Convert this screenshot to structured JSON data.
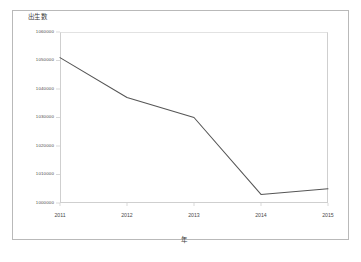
{
  "chart_data": {
    "type": "line",
    "title": "",
    "xlabel": "年",
    "ylabel": "出生数",
    "categories": [
      "2011",
      "2012",
      "2013",
      "2014",
      "2015"
    ],
    "x": [
      2011,
      2012,
      2013,
      2014,
      2015
    ],
    "values": [
      1051000,
      1037000,
      1030000,
      1003000,
      1005000
    ],
    "series": [
      {
        "name": "出生数",
        "values": [
          1051000,
          1037000,
          1030000,
          1003000,
          1005000
        ],
        "color": "#555555"
      }
    ],
    "ylim": [
      1000000,
      1060000
    ],
    "xlim": [
      2011,
      2015
    ],
    "yticks": [
      1060000,
      1050000,
      1040000,
      1030000,
      1020000,
      1010000,
      1000000
    ],
    "ytick_labels": [
      "1060000",
      "1050000",
      "1040000",
      "1030000",
      "1020000",
      "1010000",
      "1000000"
    ],
    "xticks": [
      2011,
      2012,
      2013,
      2014,
      2015
    ],
    "xtick_labels": [
      "2011",
      "2012",
      "2013",
      "2014",
      "2015"
    ],
    "grid": false,
    "legend": false,
    "legend_position": "none"
  },
  "axes": {
    "y_title": "出生数",
    "x_title": "年",
    "y_tick_0": "1060000",
    "y_tick_1": "1050000",
    "y_tick_2": "1040000",
    "y_tick_3": "1030000",
    "y_tick_4": "1020000",
    "y_tick_5": "1010000",
    "y_tick_6": "1000000",
    "x_tick_0": "2011",
    "x_tick_1": "2012",
    "x_tick_2": "2013",
    "x_tick_3": "2014",
    "x_tick_4": "2015"
  },
  "colors": {
    "line": "#555555",
    "axis": "#cfcfcf",
    "frame": "#b9b9b9",
    "text": "#4a4a4a",
    "background": "#ffffff"
  }
}
